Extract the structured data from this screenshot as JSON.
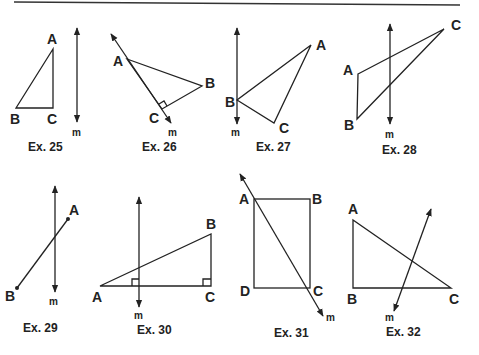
{
  "exercises": [
    {
      "caption": "Ex. 25",
      "line_label": "m",
      "points": [
        "A",
        "B",
        "C"
      ]
    },
    {
      "caption": "Ex. 26",
      "line_label": "m",
      "points": [
        "A",
        "B",
        "C"
      ]
    },
    {
      "caption": "Ex. 27",
      "line_label": "m",
      "points": [
        "A",
        "B",
        "C"
      ]
    },
    {
      "caption": "Ex. 28",
      "line_label": "m",
      "points": [
        "A",
        "B",
        "C"
      ]
    },
    {
      "caption": "Ex. 29",
      "line_label": "m",
      "points": [
        "A",
        "B"
      ]
    },
    {
      "caption": "Ex. 30",
      "line_label": "m",
      "points": [
        "A",
        "B",
        "C"
      ]
    },
    {
      "caption": "Ex. 31",
      "line_label": "m",
      "points": [
        "A",
        "B",
        "C",
        "D"
      ]
    },
    {
      "caption": "Ex. 32",
      "line_label": "m",
      "points": [
        "A",
        "B",
        "C"
      ]
    }
  ]
}
